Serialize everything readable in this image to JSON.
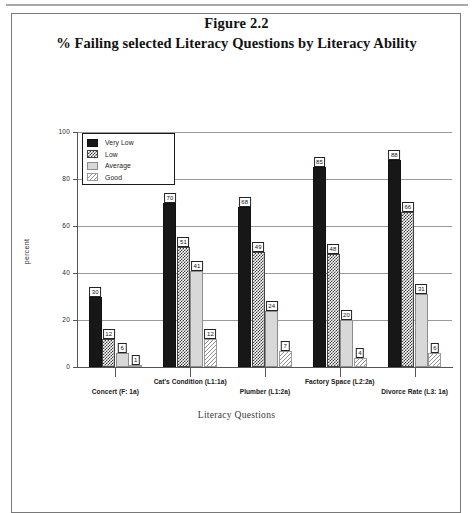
{
  "figure": {
    "number": "Figure 2.2",
    "subtitle": "% Failing selected Literacy Questions by Literacy Ability"
  },
  "chart_data": {
    "type": "bar",
    "title": "% Failing selected Literacy Questions by Literacy Ability",
    "subtitle": "Figure 2.2",
    "xlabel": "Literacy Questions",
    "ylabel": "percent",
    "ylim": [
      0,
      100
    ],
    "yticks": [
      0,
      20,
      40,
      60,
      80,
      100
    ],
    "grid": true,
    "legend_position": "upper-left-inside",
    "categories": [
      "Concert (F: 1a)",
      "Cat's Condition (L1:1a)",
      "Plumber (L1:2a)",
      "Factory Space (L2:2a)",
      "Divorce Rate (L3: 1a)"
    ],
    "series": [
      {
        "name": "Very Low",
        "pattern": "solid-black",
        "values": [
          30,
          70,
          68,
          85,
          88
        ]
      },
      {
        "name": "Low",
        "pattern": "checkerboard",
        "values": [
          12,
          51,
          49,
          48,
          66
        ]
      },
      {
        "name": "Average",
        "pattern": "light-solid",
        "values": [
          6,
          41,
          24,
          20,
          31
        ]
      },
      {
        "name": "Good",
        "pattern": "sparse-hatch",
        "values": [
          1,
          12,
          7,
          4,
          6
        ]
      }
    ]
  },
  "legend": {
    "items": [
      {
        "label": "Very Low"
      },
      {
        "label": "Low"
      },
      {
        "label": "Average"
      },
      {
        "label": "Good"
      }
    ]
  },
  "axes": {
    "y_title": "percent",
    "x_title": "Literacy Questions",
    "y_ticks": [
      "0",
      "20",
      "40",
      "60",
      "80",
      "100"
    ]
  }
}
